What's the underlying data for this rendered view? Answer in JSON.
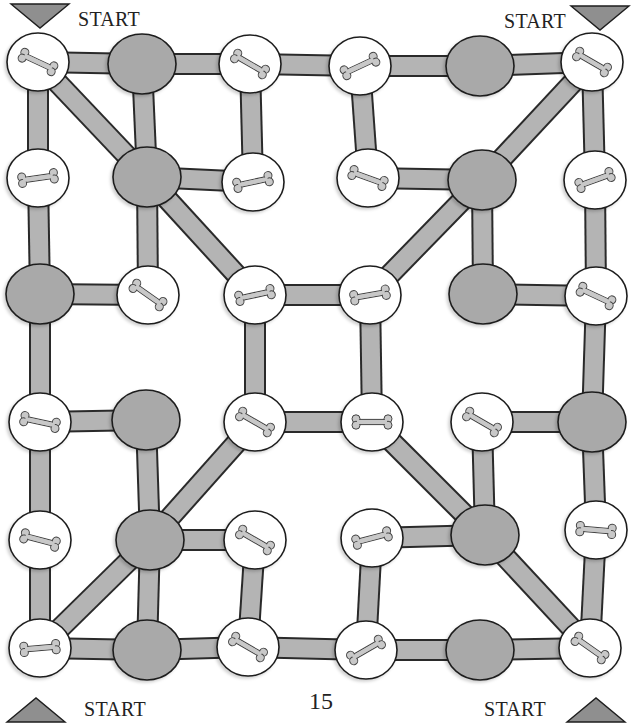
{
  "page": {
    "page_number": "15",
    "start_labels": [
      {
        "id": "top-left",
        "text": "START",
        "x": 78,
        "y": 22,
        "arrow": "down",
        "ax": 40,
        "ay": 14
      },
      {
        "id": "top-right",
        "text": "START",
        "x": 504,
        "y": 24,
        "arrow": "down",
        "ax": 600,
        "ay": 16
      },
      {
        "id": "bottom-left",
        "text": "START",
        "x": 84,
        "y": 712,
        "arrow": "up",
        "ax": 36,
        "ay": 712
      },
      {
        "id": "bottom-right",
        "text": "START",
        "x": 484,
        "y": 712,
        "arrow": "up",
        "ax": 596,
        "ay": 712
      }
    ]
  },
  "colors": {
    "path_fill": "#b4b4b4",
    "path_stroke": "#2a2a2a",
    "gray_node": "#a9a9a9",
    "bone_node": "#ffffff",
    "bone_fill": "#c8c8c8",
    "triangle": "#8f8f8f",
    "outline": "#1e1e1e"
  },
  "nodes": [
    {
      "id": "n00",
      "type": "bone",
      "x": 38,
      "y": 62,
      "angle": 25
    },
    {
      "id": "n01",
      "type": "gray",
      "x": 142,
      "y": 64
    },
    {
      "id": "n02",
      "type": "bone",
      "x": 250,
      "y": 64,
      "angle": 30
    },
    {
      "id": "n03",
      "type": "bone",
      "x": 360,
      "y": 66,
      "angle": -25
    },
    {
      "id": "n04",
      "type": "gray",
      "x": 480,
      "y": 66
    },
    {
      "id": "n05",
      "type": "bone",
      "x": 592,
      "y": 62,
      "angle": 30
    },
    {
      "id": "n10",
      "type": "bone",
      "x": 38,
      "y": 178,
      "angle": -8
    },
    {
      "id": "n11",
      "type": "gray",
      "x": 147,
      "y": 177
    },
    {
      "id": "n12",
      "type": "bone",
      "x": 253,
      "y": 182,
      "angle": -12
    },
    {
      "id": "n13",
      "type": "bone",
      "x": 368,
      "y": 178,
      "angle": 20
    },
    {
      "id": "n14",
      "type": "gray",
      "x": 482,
      "y": 180
    },
    {
      "id": "n15",
      "type": "bone",
      "x": 595,
      "y": 180,
      "angle": -20
    },
    {
      "id": "n20",
      "type": "gray",
      "x": 40,
      "y": 294
    },
    {
      "id": "n21",
      "type": "bone",
      "x": 148,
      "y": 295,
      "angle": 35
    },
    {
      "id": "n22",
      "type": "bone",
      "x": 255,
      "y": 295,
      "angle": -12
    },
    {
      "id": "n23",
      "type": "bone",
      "x": 370,
      "y": 295,
      "angle": -10
    },
    {
      "id": "n24",
      "type": "gray",
      "x": 483,
      "y": 294
    },
    {
      "id": "n25",
      "type": "bone",
      "x": 596,
      "y": 296,
      "angle": 25
    },
    {
      "id": "n30",
      "type": "bone",
      "x": 40,
      "y": 422,
      "angle": 12
    },
    {
      "id": "n31",
      "type": "gray",
      "x": 146,
      "y": 420
    },
    {
      "id": "n32",
      "type": "bone",
      "x": 255,
      "y": 422,
      "angle": 30
    },
    {
      "id": "n33",
      "type": "bone",
      "x": 372,
      "y": 422,
      "angle": 0
    },
    {
      "id": "n34",
      "type": "bone",
      "x": 482,
      "y": 422,
      "angle": 30
    },
    {
      "id": "n35",
      "type": "gray",
      "x": 592,
      "y": 422
    },
    {
      "id": "n40",
      "type": "bone",
      "x": 40,
      "y": 540,
      "angle": 15
    },
    {
      "id": "n41",
      "type": "gray",
      "x": 150,
      "y": 540
    },
    {
      "id": "n42",
      "type": "bone",
      "x": 255,
      "y": 540,
      "angle": 30
    },
    {
      "id": "n43",
      "type": "bone",
      "x": 372,
      "y": 538,
      "angle": -15
    },
    {
      "id": "n44",
      "type": "gray",
      "x": 485,
      "y": 535
    },
    {
      "id": "n45",
      "type": "bone",
      "x": 596,
      "y": 530,
      "angle": 5
    },
    {
      "id": "n50",
      "type": "bone",
      "x": 40,
      "y": 648,
      "angle": -5
    },
    {
      "id": "n51",
      "type": "gray",
      "x": 147,
      "y": 650
    },
    {
      "id": "n52",
      "type": "bone",
      "x": 248,
      "y": 647,
      "angle": 30
    },
    {
      "id": "n53",
      "type": "bone",
      "x": 366,
      "y": 650,
      "angle": -30
    },
    {
      "id": "n54",
      "type": "gray",
      "x": 480,
      "y": 650
    },
    {
      "id": "n55",
      "type": "bone",
      "x": 590,
      "y": 648,
      "angle": 35
    }
  ],
  "edges": [
    [
      "n00",
      "n01"
    ],
    [
      "n01",
      "n02"
    ],
    [
      "n02",
      "n03"
    ],
    [
      "n03",
      "n04"
    ],
    [
      "n04",
      "n05"
    ],
    [
      "n00",
      "n10"
    ],
    [
      "n01",
      "n11"
    ],
    [
      "n02",
      "n12"
    ],
    [
      "n03",
      "n13"
    ],
    [
      "n05",
      "n15"
    ],
    [
      "n00",
      "n11"
    ],
    [
      "n05",
      "n14"
    ],
    [
      "n11",
      "n12"
    ],
    [
      "n13",
      "n14"
    ],
    [
      "n10",
      "n20"
    ],
    [
      "n11",
      "n21"
    ],
    [
      "n11",
      "n22"
    ],
    [
      "n14",
      "n24"
    ],
    [
      "n14",
      "n23"
    ],
    [
      "n15",
      "n25"
    ],
    [
      "n20",
      "n21"
    ],
    [
      "n22",
      "n23"
    ],
    [
      "n24",
      "n25"
    ],
    [
      "n20",
      "n30"
    ],
    [
      "n22",
      "n32"
    ],
    [
      "n23",
      "n33"
    ],
    [
      "n25",
      "n35"
    ],
    [
      "n30",
      "n31"
    ],
    [
      "n32",
      "n33"
    ],
    [
      "n34",
      "n35"
    ],
    [
      "n30",
      "n40"
    ],
    [
      "n31",
      "n41"
    ],
    [
      "n32",
      "n41"
    ],
    [
      "n33",
      "n44"
    ],
    [
      "n34",
      "n44"
    ],
    [
      "n35",
      "n45"
    ],
    [
      "n41",
      "n42"
    ],
    [
      "n43",
      "n44"
    ],
    [
      "n40",
      "n50"
    ],
    [
      "n41",
      "n51"
    ],
    [
      "n41",
      "n50"
    ],
    [
      "n42",
      "n52"
    ],
    [
      "n43",
      "n53"
    ],
    [
      "n44",
      "n55"
    ],
    [
      "n45",
      "n55"
    ],
    [
      "n50",
      "n51"
    ],
    [
      "n51",
      "n52"
    ],
    [
      "n52",
      "n53"
    ],
    [
      "n53",
      "n54"
    ],
    [
      "n54",
      "n55"
    ]
  ]
}
